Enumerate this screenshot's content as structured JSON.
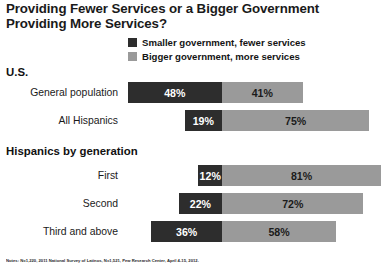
{
  "title": {
    "line1": "Providing Fewer Services or a Bigger Government",
    "line2": "Providing More Services?"
  },
  "legend": {
    "items": [
      {
        "label": "Smaller government, fewer services",
        "color": "#2d2d2d",
        "key": "smaller"
      },
      {
        "label": "Bigger government, more services",
        "color": "#9a9a9a",
        "key": "bigger"
      }
    ]
  },
  "sections": [
    {
      "heading": "U.S."
    },
    {
      "heading": "Hispanics by generation"
    }
  ],
  "footnote": "Notes: N=1,220, 2011 National Survey of Latinos, N=1,521, Pew Research Center, April 4-15, 2012.",
  "chart_data": {
    "type": "bar",
    "title": "Providing Fewer Services or a Bigger Government Providing More Services?",
    "xlabel": "",
    "ylabel": "",
    "orientation": "horizontal",
    "layout": "diverging-stacked",
    "grid": false,
    "legend_position": "top-center",
    "categories": [
      "General population",
      "All Hispanics",
      "First",
      "Second",
      "Third and above"
    ],
    "series": [
      {
        "name": "Smaller government, fewer services",
        "color": "#2d2d2d",
        "direction": "left",
        "values": [
          48,
          19,
          12,
          22,
          36
        ],
        "labels": [
          "48%",
          "19%",
          "12%",
          "22%",
          "36%"
        ]
      },
      {
        "name": "Bigger government, more services",
        "color": "#9a9a9a",
        "direction": "right",
        "values": [
          41,
          75,
          81,
          72,
          58
        ],
        "labels": [
          "41%",
          "75%",
          "81%",
          "72%",
          "58%"
        ]
      }
    ],
    "groups": [
      {
        "heading": "U.S.",
        "categories": [
          "General population",
          "All Hispanics"
        ]
      },
      {
        "heading": "Hispanics by generation",
        "categories": [
          "First",
          "Second",
          "Third and above"
        ]
      }
    ]
  }
}
